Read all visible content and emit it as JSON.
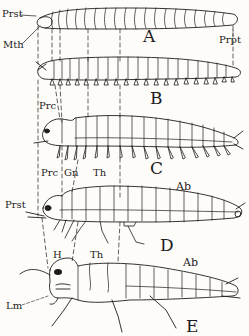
{
  "figure": {
    "panels": [
      {
        "id": "A",
        "label": "A"
      },
      {
        "id": "B",
        "label": "B"
      },
      {
        "id": "C",
        "label": "C"
      },
      {
        "id": "D",
        "label": "D"
      },
      {
        "id": "E",
        "label": "E"
      }
    ],
    "annotations": {
      "prst_a": "Prst",
      "mth": "Mth",
      "prpt": "Prpt",
      "prc_b": "Prc",
      "prc_c": "Prc",
      "gn": "Gn",
      "th_c": "Th",
      "ab_c": "Ab",
      "prst_d": "Prst",
      "ab_d": "Ab",
      "h": "H",
      "th_e": "Th",
      "lm": "Lm"
    },
    "colors": {
      "ink": "#1d1d1d",
      "paper": "#fdfcf9"
    }
  }
}
